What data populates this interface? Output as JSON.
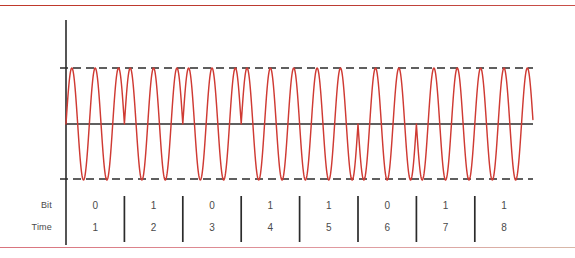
{
  "figure": {
    "accent_color": "#cf3a33",
    "axis_color": "#2b2b2b",
    "rule_top_color": "#c0392b",
    "rule_bottom_color": "#d9737d"
  },
  "rows": {
    "bit_label": "Bit",
    "time_label": "Time"
  },
  "chart_data": {
    "type": "line",
    "xlabel": "Time",
    "ylabel": "",
    "grid": false,
    "legend": null,
    "categories": [
      "1",
      "2",
      "3",
      "4",
      "5",
      "6",
      "7",
      "8"
    ],
    "bits": [
      "0",
      "1",
      "0",
      "1",
      "1",
      "0",
      "1",
      "1"
    ],
    "times": [
      "1",
      "2",
      "3",
      "4",
      "5",
      "6",
      "7",
      "8"
    ],
    "modulation": "PSK",
    "cycles_per_bit": 2.5,
    "amplitude": 1,
    "ylim": [
      -1,
      1
    ],
    "envelope_upper": 1,
    "envelope_lower": -1,
    "zero_level": 0,
    "phase_map": {
      "0": 0,
      "1": 180
    },
    "series": [
      {
        "name": "carrier",
        "description": "Constant-amplitude carrier whose phase flips 180 degrees when the bit value changes"
      }
    ]
  },
  "geometry": {
    "axis_x": 66,
    "axis_top_y": 20,
    "axis_bottom_y": 245,
    "plot_right_x": 533,
    "upper_env_y": 68,
    "zero_y": 124,
    "lower_env_y": 179,
    "bit_width": 58.4,
    "tick_top_y": 196,
    "tick_bottom_y": 242
  }
}
